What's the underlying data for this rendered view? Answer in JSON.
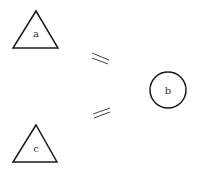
{
  "diagram": {
    "nodes": [
      {
        "id": "a",
        "label": "a",
        "shape": "triangle"
      },
      {
        "id": "b",
        "label": "b",
        "shape": "circle"
      },
      {
        "id": "c",
        "label": "c",
        "shape": "triangle"
      }
    ],
    "edges": [
      {
        "from": "a",
        "to": "b",
        "marker": "double-line"
      },
      {
        "from": "c",
        "to": "b",
        "marker": "double-line"
      }
    ],
    "colors": {
      "stroke": "#1a1a1a",
      "label": "#333333",
      "background": "#ffffff"
    }
  }
}
